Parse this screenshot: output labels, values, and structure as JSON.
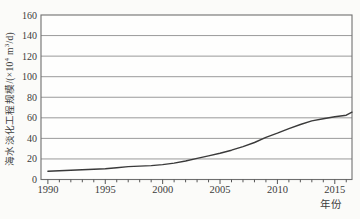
{
  "labels": {
    "ylabel_prefix": "海水淡化工程规模/(×10",
    "ylabel_sup1": "4",
    "ylabel_mid": " m",
    "ylabel_sup2": "3",
    "ylabel_suffix": "/d)"
  },
  "colors": {
    "background": "#fbfbf9",
    "plot_background": "#fefefd",
    "grid": "#9a9a9a",
    "frame": "#6f6f6f",
    "line": "#3a3a3a",
    "tick": "#555555",
    "text": "#3c3c3c"
  },
  "chart_data": {
    "type": "line",
    "title": "",
    "xlabel": "年份",
    "ylabel": "海水淡化工程规模/(×10⁴ m³/d)",
    "xlim": [
      1989.4,
      2016.5
    ],
    "ylim": [
      0,
      160
    ],
    "x_ticks": [
      1990,
      1995,
      2000,
      2005,
      2010,
      2015
    ],
    "minor_x_tick_step": 1,
    "y_ticks": [
      0,
      20,
      40,
      60,
      80,
      100,
      120,
      140,
      160
    ],
    "grid": "horizontal",
    "legend": "none",
    "series": [
      {
        "name": "海水淡化工程规模",
        "x": [
          1990,
          1991,
          1992,
          1993,
          1994,
          1995,
          1996,
          1997,
          1998,
          1999,
          2000,
          2001,
          2002,
          2003,
          2004,
          2005,
          2006,
          2007,
          2008,
          2009,
          2010,
          2011,
          2012,
          2013,
          2014,
          2015,
          2016,
          2016.5
        ],
        "y": [
          8,
          8.5,
          9,
          9.5,
          10,
          10.5,
          11.5,
          12.5,
          13,
          13.5,
          14.5,
          16,
          18,
          20.5,
          23,
          25.5,
          28.5,
          32,
          36,
          41,
          45,
          49.5,
          53.5,
          57,
          59,
          61,
          62.5,
          65.5
        ]
      }
    ]
  }
}
